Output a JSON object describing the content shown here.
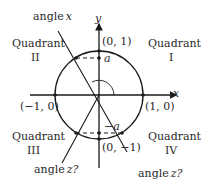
{
  "diagram": {
    "axes": {
      "x_label": "x",
      "y_label": "y"
    },
    "points": {
      "top": "(0, 1)",
      "bottom": "(0, −1)",
      "left": "(−1, 0)",
      "right": "(1, 0)"
    },
    "quadrants": {
      "q1": {
        "word": "Quadrant",
        "numeral": "I"
      },
      "q2": {
        "word": "Quadrant",
        "numeral": "II"
      },
      "q3": {
        "word": "Quadrant",
        "numeral": "III"
      },
      "q4": {
        "word": "Quadrant",
        "numeral": "IV"
      }
    },
    "angles": {
      "x_word": "angle",
      "x_var": "x",
      "z3_word": "angle",
      "z3_var": "z?",
      "z4_word": "angle",
      "z4_var": "z?"
    },
    "values": {
      "a_top": "a",
      "a_bottom": "−a"
    },
    "colors": {
      "stroke": "#1a1a1a",
      "text": "#2a2a2a"
    }
  }
}
